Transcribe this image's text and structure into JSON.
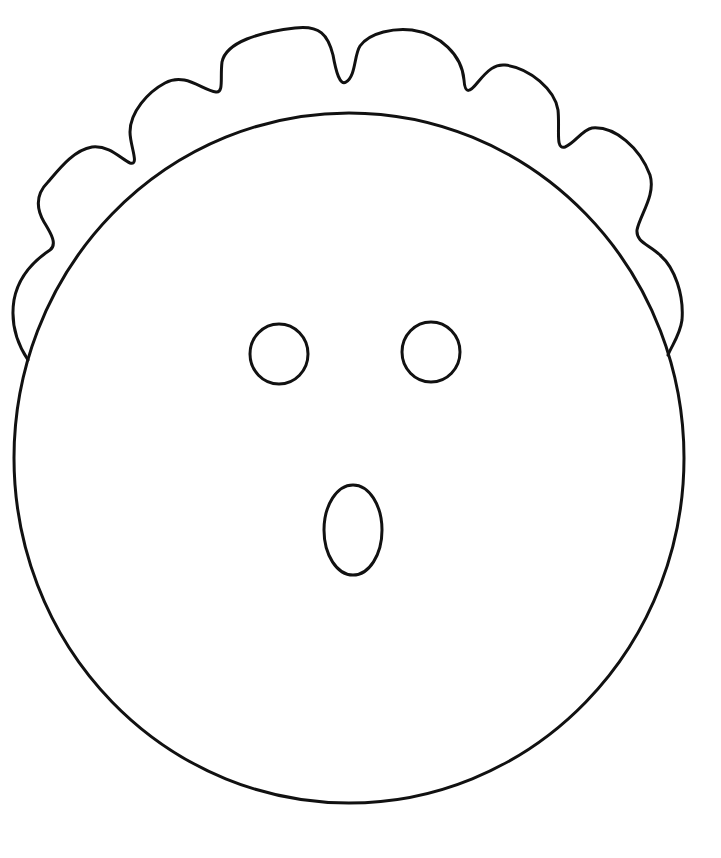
{
  "page": {
    "background_color": "#ffffff",
    "line_color": "#111111",
    "line_width": 3
  },
  "caption": {
    "text": "",
    "note": "cropped-off text at top edge, illegible"
  },
  "drawing": {
    "subject": "surprised face with curly hair",
    "face": {
      "cx": 349,
      "cy": 458,
      "rx": 335,
      "ry": 345
    },
    "left_eye": {
      "cx": 279,
      "cy": 354,
      "rx": 30,
      "ry": 30
    },
    "right_eye": {
      "cx": 431,
      "cy": 352,
      "rx": 30,
      "ry": 30
    },
    "mouth": {
      "cx": 353,
      "cy": 530,
      "rx": 30,
      "ry": 46
    }
  }
}
